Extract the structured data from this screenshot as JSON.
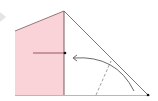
{
  "diagram": {
    "type": "fold-diagram",
    "colors": {
      "paper_fill": "#f9d3d7",
      "line": "#6b4a4f",
      "diagonal": "#555555",
      "baseline": "#aaaaaa",
      "arrow": "#333333",
      "dot": "#111111",
      "play_icon": "#e0e0e0"
    },
    "shapes": {
      "pink_panel": "15,31 64,11 64,95 15,95",
      "diagonal": [
        64,
        11,
        148,
        95
      ],
      "baseline": [
        15,
        95,
        150,
        95
      ],
      "horizontal_marker": [
        33,
        53,
        64,
        53
      ],
      "dashed_crease": [
        96,
        95,
        110,
        62
      ],
      "fold_arrow_path": "M 134 91 Q 115 55 73 58",
      "dots": [
        [
          65,
          53
        ],
        [
          148,
          95
        ]
      ]
    },
    "icons": [
      "play-icon",
      "dot-icon",
      "curved-arrow-icon"
    ]
  }
}
